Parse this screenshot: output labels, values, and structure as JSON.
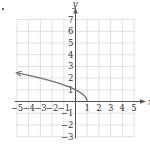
{
  "figure": {
    "label_marker": "."
  },
  "chart_data": {
    "type": "line",
    "title": "",
    "xlabel": "x",
    "ylabel": "y",
    "xlim": [
      -5,
      5
    ],
    "ylim": [
      -3,
      7
    ],
    "grid": true,
    "x_ticks": [
      -5,
      -4,
      -3,
      -2,
      -1,
      1,
      2,
      3,
      4,
      5
    ],
    "y_ticks": [
      -3,
      -2,
      -1,
      1,
      2,
      3,
      4,
      5,
      6,
      7
    ],
    "x_tick_labels": [
      "−5",
      "−4",
      "−3",
      "−2",
      "−1",
      "1",
      "2",
      "3",
      "4",
      "5"
    ],
    "y_tick_labels": [
      "−3",
      "−2",
      "−1",
      "1",
      "2",
      "3",
      "4",
      "5",
      "6",
      "7"
    ],
    "series": [
      {
        "name": "y = √(1 − x)",
        "x": [
          1,
          0.75,
          0.5,
          0,
          -1,
          -2,
          -3,
          -4,
          -5
        ],
        "y": [
          0,
          0.5,
          0.71,
          1,
          1.41,
          1.73,
          2,
          2.24,
          2.45
        ],
        "color": "#7a7a7a",
        "arrow": "left",
        "endpoint": [
          1,
          0
        ]
      }
    ],
    "colors": {
      "grid": "#d9d9d9",
      "axis": "#555555",
      "curve": "#7a7a7a",
      "text": "#333333"
    }
  }
}
